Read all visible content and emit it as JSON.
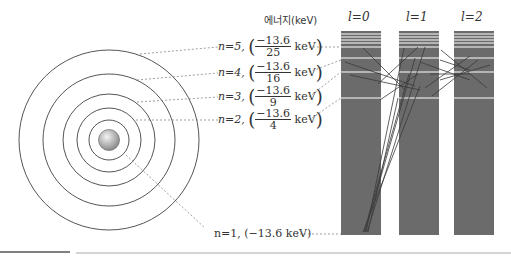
{
  "energy_axis_title": "에너지(keV)",
  "levels": [
    {
      "n_label": "n=5,",
      "numerator": "−13.6",
      "denominator": "25",
      "unit": "keV"
    },
    {
      "n_label": "n=4,",
      "numerator": "−13.6",
      "denominator": "16",
      "unit": "keV"
    },
    {
      "n_label": "n=3,",
      "numerator": "−13.6",
      "denominator": "9",
      "unit": "keV"
    },
    {
      "n_label": "n=2,",
      "numerator": "−13.6",
      "denominator": "4",
      "unit": "keV"
    }
  ],
  "ground_level": {
    "label": "n=1, (−13.6 keV)"
  },
  "columns": [
    {
      "label": "l=0"
    },
    {
      "label": "l=1"
    },
    {
      "label": "l=2"
    }
  ],
  "colors": {
    "bar": "#6b6b6b",
    "line": "#555555",
    "level_gap": "#ffffff"
  }
}
